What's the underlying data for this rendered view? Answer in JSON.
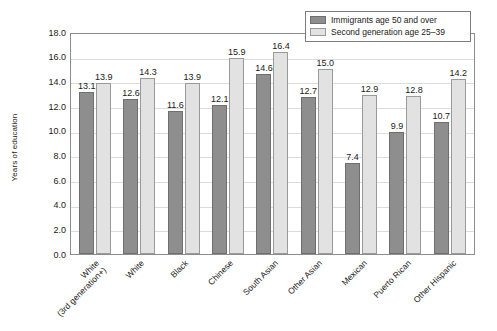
{
  "chart_data": {
    "type": "bar",
    "title": "",
    "xlabel": "",
    "ylabel": "Years of education",
    "ylim": [
      0.0,
      18.0
    ],
    "ytick_step": 2.0,
    "ytick_labels": [
      "0.0",
      "2.0",
      "4.0",
      "6.0",
      "8.0",
      "10.0",
      "12.0",
      "14.0",
      "16.0",
      "18.0"
    ],
    "ytick_values": [
      0.0,
      2.0,
      4.0,
      6.0,
      8.0,
      10.0,
      12.0,
      14.0,
      16.0,
      18.0
    ],
    "grid": true,
    "grid_axis": "y",
    "legend_position": "top-right",
    "categories": [
      "White\n(3rd generation+)",
      "White",
      "Black",
      "Chinese",
      "South Asian",
      "Other Asian",
      "Mexican",
      "Puerto Rican",
      "Other Hispanic"
    ],
    "category_lines": [
      [
        "White",
        "(3rd generation+)"
      ],
      [
        "White"
      ],
      [
        "Black"
      ],
      [
        "Chinese"
      ],
      [
        "South Asian"
      ],
      [
        "Other Asian"
      ],
      [
        "Mexican"
      ],
      [
        "Puerto Rican"
      ],
      [
        "Other Hispanic"
      ]
    ],
    "series": [
      {
        "name": "Immigrants age 50 and over",
        "color": "#8e8e8e",
        "values": [
          13.1,
          12.6,
          11.6,
          12.1,
          14.6,
          12.7,
          7.4,
          9.9,
          10.7
        ],
        "labels": [
          "13.1",
          "12.6",
          "11.6",
          "12.1",
          "14.6",
          "12.7",
          "7.4",
          "9.9",
          "10.7"
        ]
      },
      {
        "name": "Second generation age 25-39",
        "color": "#e2e2e2",
        "values": [
          13.9,
          14.3,
          13.9,
          15.9,
          16.4,
          15.0,
          12.9,
          12.8,
          14.2
        ],
        "labels": [
          "13.9",
          "14.3",
          "13.9",
          "15.9",
          "16.4",
          "15.0",
          "12.9",
          "12.8",
          "14.2"
        ]
      }
    ],
    "legend_entries": [
      "Immigrants age 50 and over",
      "Second generation age 25–39"
    ]
  }
}
